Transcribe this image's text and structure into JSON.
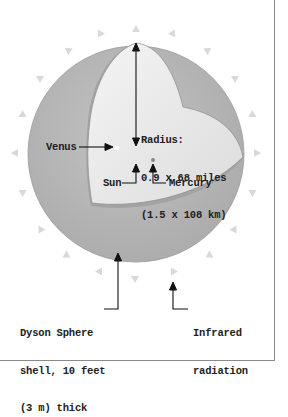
{
  "diagram": {
    "labels": {
      "radius": {
        "line1": "Radius:",
        "line2": "0.9 x 68 miles",
        "line3": "(1.5 x 108 km)"
      },
      "venus": "Venus",
      "sun": "Sun",
      "mercury": "Mercury",
      "shell": {
        "line1": "Dyson Sphere",
        "line2": "shell, 10 feet",
        "line3": "(3 m) thick"
      },
      "infrared": {
        "line1": "Infrared",
        "line2": "radiation"
      }
    },
    "colors": {
      "shell_outer": "#b4b4b4",
      "shell_inner_band": "#a6a6a6",
      "interior": "#ececec",
      "interior_edge": "#d2d2d2",
      "radiation_arrows": "#d8d8d8",
      "leader_lines": "#111111",
      "frame": "#8a8a8a"
    },
    "radiation_arrow_count": 20
  }
}
